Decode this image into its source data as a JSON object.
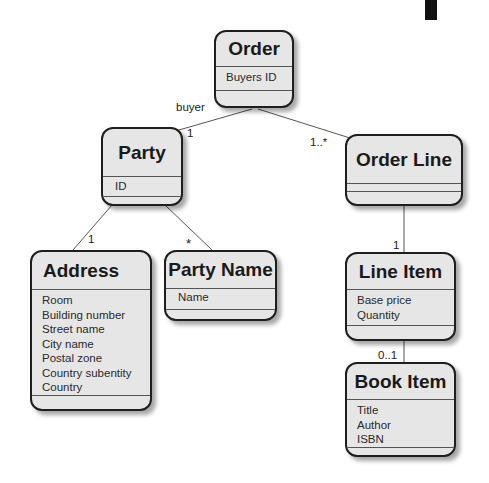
{
  "classes": {
    "order": {
      "name": "Order",
      "attributes": [
        "Buyers ID"
      ]
    },
    "party": {
      "name": "Party",
      "attributes": [
        "ID"
      ]
    },
    "order_line": {
      "name": "Order Line",
      "attributes": []
    },
    "address": {
      "name": "Address",
      "attributes": [
        "Room",
        "Building number",
        "Street name",
        "City name",
        "Postal zone",
        "Country subentity",
        "Country"
      ]
    },
    "party_name": {
      "name": "Party Name",
      "attributes": [
        "Name"
      ]
    },
    "line_item": {
      "name": "Line Item",
      "attributes": [
        "Base price",
        "Quantity"
      ]
    },
    "book_item": {
      "name": "Book Item",
      "attributes": [
        "Title",
        "Author",
        "ISBN"
      ]
    }
  },
  "associations": {
    "order_party": {
      "role": "buyer",
      "multiplicity": "1"
    },
    "order_orderline": {
      "multiplicity": "1..*"
    },
    "party_address": {
      "multiplicity": "1"
    },
    "party_partyname": {
      "multiplicity": "*"
    },
    "orderline_lineitem": {
      "multiplicity": "1"
    },
    "lineitem_bookitem": {
      "multiplicity": "0..1"
    }
  }
}
